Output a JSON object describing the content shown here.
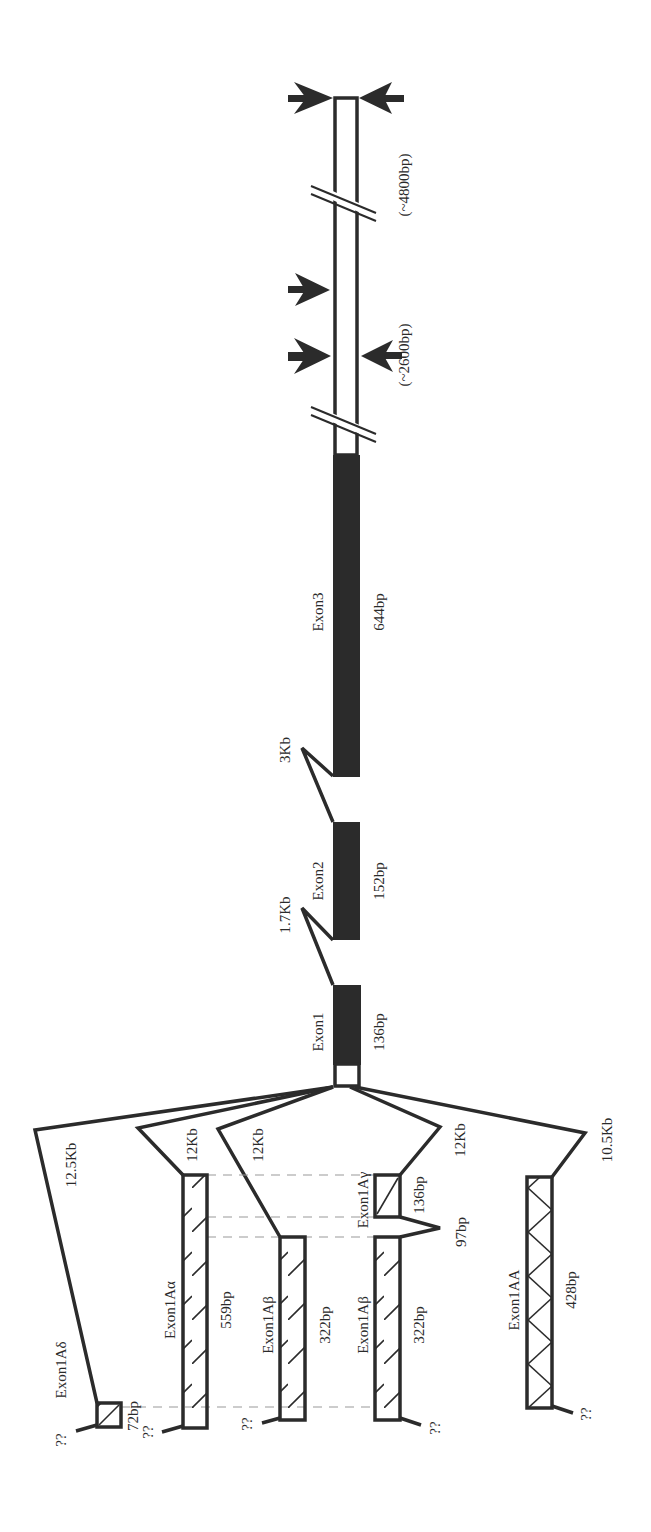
{
  "figure": {
    "type": "gene-structure-diagram",
    "orientation": "rotated-90",
    "colors": {
      "line": "#2b2b2b",
      "coding_exon_fill": "#2b2b2b",
      "utr_fill": "#ffffff",
      "background": "#ffffff",
      "dashed_guide": "#9a9a9a"
    }
  },
  "main_gene": {
    "exons": [
      {
        "name": "Exon1",
        "size": "136bp"
      },
      {
        "name": "Exon2",
        "size": "152bp"
      },
      {
        "name": "Exon3",
        "size": "644bp"
      }
    ],
    "introns": [
      {
        "between": "Exon1-Exon2",
        "size": "1.7Kb"
      },
      {
        "between": "Exon2-Exon3",
        "size": "3Kb"
      }
    ],
    "utr_markers": [
      {
        "label": "(~2600bp)"
      },
      {
        "label": "(~4800bp)"
      }
    ]
  },
  "alternative_first_exons": [
    {
      "name": "Exon1Aδ",
      "size": "72bp",
      "intron": "12.5Kb",
      "upstream": "??"
    },
    {
      "name": "Exon1Aα",
      "size": "559bp",
      "intron": "12Kb",
      "upstream": "??"
    },
    {
      "name": "Exon1Aβ",
      "size": "322bp",
      "intron": "12Kb",
      "upstream": "??"
    },
    {
      "name": "Exon1Aγ",
      "size": "136bp",
      "intron": "12Kb"
    },
    {
      "name": "Exon1Aβ",
      "size": "322bp",
      "intron_to_gamma": "97bp",
      "upstream": "??"
    },
    {
      "name": "Exon1AA",
      "size": "428bp",
      "intron": "10.5Kb",
      "upstream": "??"
    }
  ]
}
